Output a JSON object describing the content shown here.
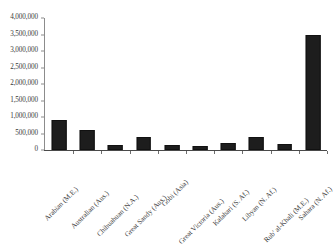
{
  "chart_data": {
    "type": "bar",
    "title": "",
    "subtitle": "",
    "xlabel": "",
    "ylabel": "",
    "ylim": [
      0,
      4000000
    ],
    "grid": false,
    "legend": false,
    "categories": [
      "Arabian (M.E.)",
      "Australian (Aus.)",
      "Chihuahuan (N.A.)",
      "Great Sandy (Aus.)",
      "Gobi (Asia)",
      "Great Victoria (Aus.)",
      "Kalahari (S. Af.)",
      "Libyan (N. Af.)",
      "Rub' al-Khali (M.E.)",
      "Sahara (N. Af.)"
    ],
    "values": [
      900000,
      600000,
      140000,
      400000,
      150000,
      130000,
      200000,
      400000,
      180000,
      3500000
    ],
    "ytick_labels": [
      "4,000,000",
      "3,500,000",
      "3,000,000",
      "2,500,000",
      "2,000,000",
      "1,500,000",
      "1,000,000",
      "500,000",
      "0"
    ],
    "ytick_values": [
      4000000,
      3500000,
      3000000,
      2500000,
      2000000,
      1500000,
      1000000,
      500000,
      0
    ],
    "series": [
      {
        "name": "Area (sq km)",
        "color": "#1d1d1d",
        "values": [
          900000,
          600000,
          140000,
          400000,
          150000,
          130000,
          200000,
          400000,
          180000,
          3500000
        ]
      }
    ]
  },
  "colors": {
    "bar": "#1d1d1d",
    "axis": "#8c8c8c",
    "text": "#3a3a3a",
    "background": "#ffffff"
  }
}
